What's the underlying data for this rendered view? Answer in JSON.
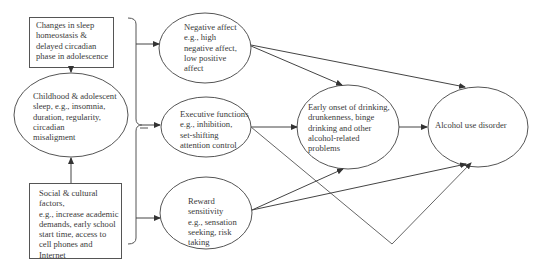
{
  "diagram": {
    "type": "path-model",
    "nodes": {
      "sleep_changes": {
        "shape": "rectangle",
        "lines": [
          "Changes in sleep",
          "homeostasis &",
          "delayed circadian",
          "phase in adolescence"
        ]
      },
      "childhood_sleep": {
        "shape": "ellipse",
        "lines": [
          "Childhood & adolescent",
          "sleep, e.g., insomnia,",
          "duration, regularity,",
          "circadian",
          "misaligment"
        ]
      },
      "social_factors": {
        "shape": "rectangle",
        "lines": [
          "Social & cultural",
          "factors,",
          "e.g., increase academic",
          "demands, early school",
          "start time, access to",
          "cell phones and",
          "Internet"
        ]
      },
      "negative_affect": {
        "shape": "ellipse",
        "lines": [
          "Negative affect",
          "e.g., high",
          "negative affect,",
          "low positive",
          "affect"
        ]
      },
      "executive_functions": {
        "shape": "ellipse",
        "lines": [
          "Executive functions",
          "e.g., inhibition,",
          "set-shifting",
          "attention control"
        ]
      },
      "reward_sensitivity": {
        "shape": "ellipse",
        "lines": [
          "Reward",
          "sensitivity",
          "e.g., sensation",
          "seeking, risk",
          "taking"
        ]
      },
      "early_onset": {
        "shape": "ellipse",
        "lines": [
          "Early onset of drinking,",
          "drunkenness, binge",
          "drinking and other",
          "alcohol-related",
          "problems"
        ]
      },
      "alcohol_use_disorder": {
        "shape": "ellipse",
        "lines": [
          "Alcohol use disorder"
        ]
      }
    },
    "edges": [
      {
        "from": "sleep_changes",
        "to": "childhood_sleep"
      },
      {
        "from": "social_factors",
        "to": "childhood_sleep"
      },
      {
        "from": "brace",
        "to": "negative_affect"
      },
      {
        "from": "brace",
        "to": "executive_functions"
      },
      {
        "from": "brace",
        "to": "reward_sensitivity"
      },
      {
        "from": "childhood_sleep",
        "to": "brace"
      },
      {
        "from": "negative_affect",
        "to": "early_onset"
      },
      {
        "from": "negative_affect",
        "to": "alcohol_use_disorder"
      },
      {
        "from": "executive_functions",
        "to": "early_onset"
      },
      {
        "from": "executive_functions",
        "to": "alcohol_use_disorder"
      },
      {
        "from": "reward_sensitivity",
        "to": "early_onset"
      },
      {
        "from": "reward_sensitivity",
        "to": "alcohol_use_disorder"
      },
      {
        "from": "early_onset",
        "to": "alcohol_use_disorder"
      }
    ],
    "colors": {
      "stroke": "#555555",
      "text": "#3a3a3a",
      "background": "#ffffff"
    }
  }
}
